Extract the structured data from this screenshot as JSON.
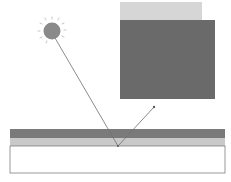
{
  "diagram": {
    "colors": {
      "background": "#ffffff",
      "sun": "#8a8a8a",
      "sun_rays": "#b5b5b5",
      "ray_line": "#6e6e6e",
      "panel_light": "#d6d6d6",
      "panel_dark": "#6a6a6a",
      "surface_dark_band": "#7a7a7a",
      "surface_light_band": "#c9c9c9",
      "base_box_fill": "#ffffff",
      "base_box_stroke": "#7f7f7f"
    },
    "elements": {
      "sun": {
        "cx": 52,
        "cy": 31,
        "r": 9
      },
      "incident_ray": {
        "x1": 55,
        "y1": 38,
        "x2": 118,
        "y2": 146
      },
      "reflected_ray": {
        "x1": 118,
        "y1": 146,
        "x2": 154,
        "y2": 107
      },
      "panel_light": {
        "x": 120,
        "y": 2,
        "w": 82,
        "h": 19
      },
      "panel_dark": {
        "x": 120,
        "y": 20,
        "w": 95,
        "h": 79
      },
      "surface_dark_band": {
        "x": 10,
        "y": 129,
        "w": 215,
        "h": 10
      },
      "surface_light_band": {
        "x": 10,
        "y": 138,
        "w": 215,
        "h": 8
      },
      "base_box": {
        "x": 10,
        "y": 146,
        "w": 215,
        "h": 27
      }
    }
  }
}
